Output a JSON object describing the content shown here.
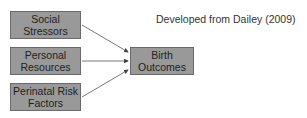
{
  "diagram": {
    "credit": "Developed from Dailey (2009)",
    "nodes": [
      {
        "id": "social-stressors",
        "line1": "Social",
        "line2": "Stressors"
      },
      {
        "id": "personal-resources",
        "line1": "Personal",
        "line2": "Resources"
      },
      {
        "id": "perinatal-risk-factors",
        "line1": "Perinatal Risk",
        "line2": "Factors"
      },
      {
        "id": "birth-outcomes",
        "line1": "Birth",
        "line2": "Outcomes"
      }
    ],
    "edges": [
      {
        "from": "social-stressors",
        "to": "birth-outcomes"
      },
      {
        "from": "personal-resources",
        "to": "birth-outcomes"
      },
      {
        "from": "perinatal-risk-factors",
        "to": "birth-outcomes"
      }
    ],
    "colors": {
      "box_fill": "#999999",
      "box_border": "#6a6a6a",
      "arrow": "#555555"
    }
  }
}
